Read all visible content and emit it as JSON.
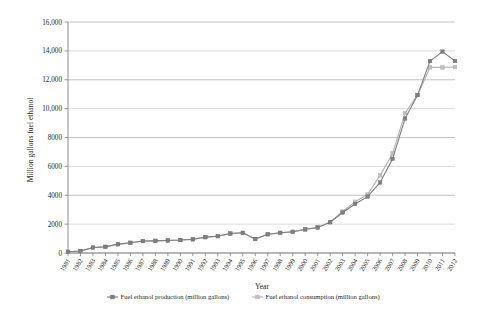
{
  "chart_data": {
    "type": "line",
    "title": "",
    "xlabel": "Year",
    "ylabel": "Million gallons fuel ethanol",
    "x": [
      1981,
      1982,
      1983,
      1984,
      1985,
      1986,
      1987,
      1988,
      1989,
      1990,
      1991,
      1992,
      1993,
      1994,
      1995,
      1996,
      1997,
      1998,
      1999,
      2000,
      2001,
      2002,
      2003,
      2004,
      2005,
      2006,
      2007,
      2008,
      2009,
      2010,
      2011,
      2012
    ],
    "xtick_labels": [
      "1981",
      "1982",
      "1983",
      "1984",
      "1985",
      "1986",
      "1987",
      "1988",
      "1989",
      "1990",
      "1991",
      "1992",
      "1993",
      "1994",
      "1995",
      "1996",
      "1997",
      "1998",
      "1999",
      "2000",
      "2001",
      "2002",
      "2003",
      "2004",
      "2005",
      "2006",
      "2007",
      "2008",
      "2009",
      "2010",
      "2011",
      "2012"
    ],
    "ytick_labels": [
      "0",
      "2000",
      "4000",
      "6000",
      "8000",
      "10,000",
      "12,000",
      "14,000",
      "16,000"
    ],
    "yticks": [
      0,
      2000,
      4000,
      6000,
      8000,
      10000,
      12000,
      14000,
      16000
    ],
    "ylim": [
      0,
      16000
    ],
    "grid": true,
    "legend_position": "bottom",
    "series": [
      {
        "name": "Fuel ethanol production (million gallons)",
        "color": "#808080",
        "marker": "square",
        "values": [
          86,
          140,
          375,
          430,
          610,
          710,
          830,
          845,
          870,
          900,
          950,
          1100,
          1170,
          1350,
          1400,
          970,
          1300,
          1400,
          1470,
          1630,
          1770,
          2130,
          2800,
          3400,
          3904,
          4884,
          6521,
          9309,
          10938,
          13298,
          13948,
          13300
        ]
      },
      {
        "name": "Fuel ethanol consumption (million gallons)",
        "color": "#b3b3b3",
        "marker": "square",
        "values": [
          83,
          136,
          370,
          425,
          600,
          700,
          820,
          840,
          865,
          895,
          945,
          1090,
          1160,
          1340,
          1390,
          960,
          1290,
          1390,
          1460,
          1650,
          1770,
          2140,
          2870,
          3550,
          4059,
          5377,
          6886,
          9683,
          10940,
          12858,
          12857,
          12880
        ]
      }
    ]
  }
}
